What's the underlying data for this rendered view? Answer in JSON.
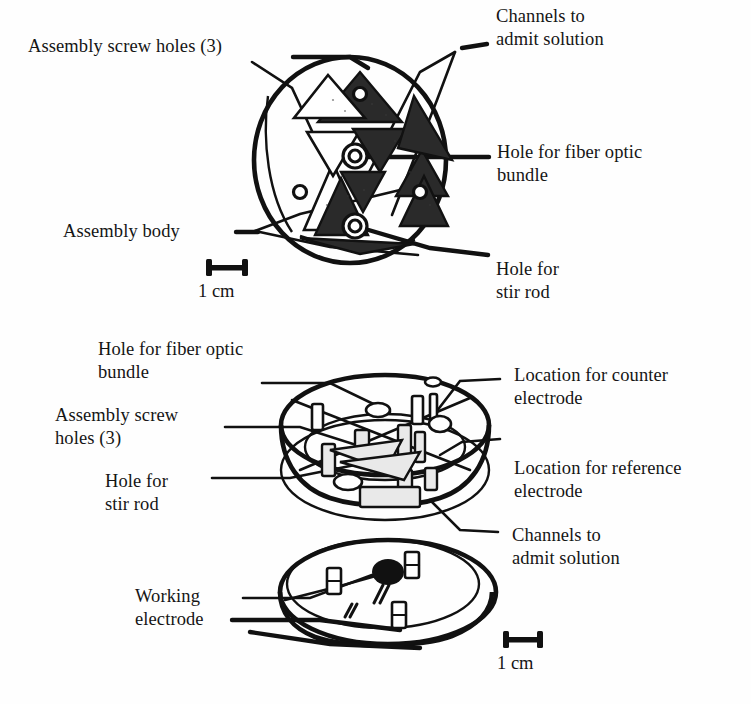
{
  "figure": {
    "type": "technical-line-drawing"
  },
  "top_view": {
    "labels": {
      "assembly_screw_holes": "Assembly screw holes (3)",
      "channels_to_admit_solution": "Channels to\nadmit solution",
      "hole_for_fiber_optic_bundle": "Hole for fiber optic\nbundle",
      "assembly_body": "Assembly body",
      "hole_for_stir_rod": "Hole for\nstir rod"
    },
    "scale": {
      "caption": "1 cm",
      "bar_length_px": 38,
      "style": "i-beam"
    }
  },
  "exploded_view": {
    "labels": {
      "hole_for_fiber_optic_bundle": "Hole for fiber optic\nbundle",
      "assembly_screw_holes": "Assembly screw\nholes (3)",
      "hole_for_stir_rod": "Hole for\nstir rod",
      "location_for_counter_electrode": "Location for counter\nelectrode",
      "location_for_reference_electrode": "Location for reference\nelectrode",
      "channels_to_admit_solution": "Channels to\nadmit solution",
      "working_electrode": "Working\nelectrode"
    },
    "scale": {
      "caption": "1 cm",
      "bar_length_px": 38,
      "style": "i-beam"
    }
  },
  "colors": {
    "ink": "#111111",
    "paper": "#fefefe",
    "hatch_fill": "#2a2a2a"
  }
}
